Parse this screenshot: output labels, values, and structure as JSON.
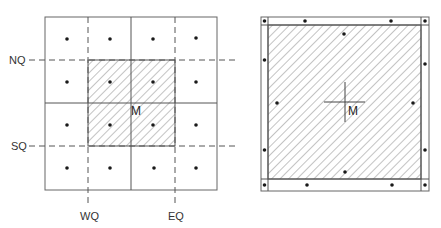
{
  "colors": {
    "line": "#555555",
    "hatch": "#777777",
    "dot": "#1a1a1a",
    "background": "#ffffff"
  },
  "left_diagram": {
    "description": "4x4 grid of cells with a dot at each cell center; central 2x2 region hatched; dashed quarter lines NQ, SQ, WQ, EQ; center point M",
    "labels": {
      "nq": "NQ",
      "sq": "SQ",
      "wq": "WQ",
      "eq": "EQ",
      "center": "M"
    },
    "grid": {
      "rows": 4,
      "cols": 4
    }
  },
  "right_diagram": {
    "description": "Square with hatched interior bordered by a thin frame strip; dots in border strip and interior; cross marking center M",
    "labels": {
      "center": "M"
    }
  }
}
